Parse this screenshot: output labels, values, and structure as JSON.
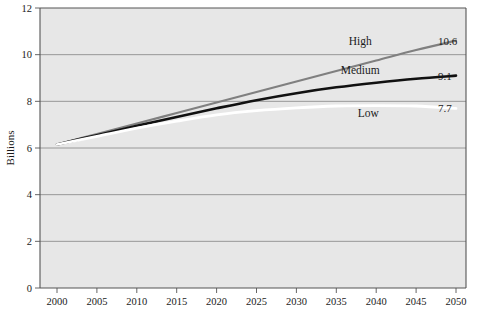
{
  "chart_data": {
    "type": "line",
    "title": "",
    "subtitle": "",
    "xlabel": "",
    "ylabel": "Billions",
    "xlim": [
      2000,
      2050
    ],
    "ylim": [
      0,
      12
    ],
    "grid": true,
    "grid_axis": "y",
    "legend_position": "inline-right",
    "x": [
      2000,
      2005,
      2010,
      2015,
      2020,
      2025,
      2030,
      2035,
      2040,
      2045,
      2050
    ],
    "xticklabels": [
      "2000",
      "2005",
      "2010",
      "2015",
      "2020",
      "2025",
      "2030",
      "2035",
      "2040",
      "2045",
      "2050"
    ],
    "yticks": [
      0,
      2,
      4,
      6,
      8,
      10,
      12
    ],
    "yticklabels": [
      "0",
      "2",
      "4",
      "6",
      "8",
      "10",
      "12"
    ],
    "series": [
      {
        "name": "High",
        "color": "#808080",
        "end_value": "10.6",
        "label": "High",
        "values": [
          6.15,
          6.6,
          7.05,
          7.5,
          7.95,
          8.4,
          8.85,
          9.3,
          9.75,
          10.2,
          10.6
        ]
      },
      {
        "name": "Medium",
        "color": "#111111",
        "end_value": "9.1",
        "label": "Medium",
        "values": [
          6.15,
          6.55,
          6.95,
          7.33,
          7.7,
          8.05,
          8.35,
          8.6,
          8.8,
          8.97,
          9.1
        ]
      },
      {
        "name": "Low",
        "color": "#ffffff",
        "end_value": "7.7",
        "label": "Low",
        "values": [
          6.15,
          6.5,
          6.85,
          7.15,
          7.42,
          7.6,
          7.72,
          7.8,
          7.82,
          7.8,
          7.7
        ]
      }
    ],
    "annotations": [
      {
        "text": "High",
        "x": 2038,
        "y": 10.6
      },
      {
        "text": "Medium",
        "x": 2038,
        "y": 9.35
      },
      {
        "text": "Low",
        "x": 2039,
        "y": 7.5
      },
      {
        "text": "10.6",
        "x": 2050,
        "y": 10.6
      },
      {
        "text": "9.1",
        "x": 2050,
        "y": 9.1
      },
      {
        "text": "7.7",
        "x": 2050,
        "y": 7.7
      }
    ],
    "plot_background": "#e7e7e7",
    "grid_color": "#8f8f8f",
    "axis_color": "#555555"
  },
  "figure": {
    "caption": ""
  }
}
